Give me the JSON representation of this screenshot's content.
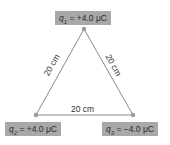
{
  "diagram": {
    "type": "equilateral-triangle-charges",
    "charges": [
      {
        "name": "q1",
        "symbol": "q",
        "sub": "1",
        "value": "= +4.0 μC",
        "position": "top"
      },
      {
        "name": "q2",
        "symbol": "q",
        "sub": "2",
        "value": "= +4.0 μC",
        "position": "bottom-left"
      },
      {
        "name": "q3",
        "symbol": "q",
        "sub": "3",
        "value": "= −4.0 μC",
        "position": "bottom-right"
      }
    ],
    "edges": [
      {
        "label": "20 cm",
        "from": "q1",
        "to": "q2"
      },
      {
        "label": "20 cm",
        "from": "q1",
        "to": "q3"
      },
      {
        "label": "20 cm",
        "from": "q2",
        "to": "q3"
      }
    ],
    "colors": {
      "line": "#8a8a8a",
      "box": "#a8a8a8",
      "vertex": "#999999"
    }
  }
}
